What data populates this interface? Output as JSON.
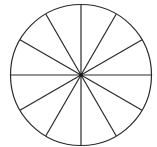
{
  "diagram": {
    "type": "circle-divided-into-sectors",
    "sectors": 12,
    "center": [
      81,
      75
    ],
    "radius": 71,
    "stroke_color": "#2a2a2a",
    "background": "#ffffff"
  }
}
